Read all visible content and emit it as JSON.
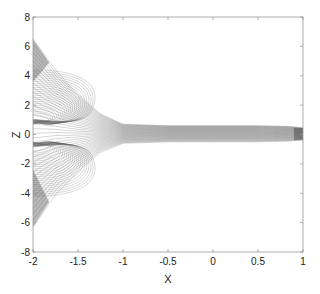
{
  "chart_data": {
    "type": "contour",
    "title": "",
    "xlabel": "X",
    "ylabel": "Z",
    "xlim": [
      -2,
      1
    ],
    "ylim": [
      -8,
      8
    ],
    "xticks": [
      -2,
      -1.5,
      -1,
      -0.5,
      0,
      0.5,
      1
    ],
    "xtick_labels": [
      "-2",
      "-1.5",
      "-1",
      "-0.5",
      "0",
      "0.5",
      "1"
    ],
    "yticks": [
      -8,
      -6,
      -4,
      -2,
      0,
      2,
      4,
      6,
      8
    ],
    "ytick_labels": [
      "-8",
      "-6",
      "-4",
      "-2",
      "0",
      "2",
      "4",
      "6",
      "8"
    ],
    "grid": false,
    "legend": null,
    "line_color": "#555555",
    "envelope": {
      "upper": [
        [
          -2,
          6.5
        ],
        [
          -1.75,
          4.4
        ],
        [
          -1.5,
          2.7
        ],
        [
          -1.25,
          1.4
        ],
        [
          -1.0,
          0.7
        ],
        [
          -0.5,
          0.6
        ],
        [
          0.0,
          0.6
        ],
        [
          0.5,
          0.6
        ],
        [
          0.85,
          0.55
        ],
        [
          1.0,
          0.45
        ]
      ],
      "lower": [
        [
          -2,
          -6.3
        ],
        [
          -1.75,
          -4.1
        ],
        [
          -1.5,
          -2.5
        ],
        [
          -1.25,
          -1.2
        ],
        [
          -1.0,
          -0.6
        ],
        [
          -0.5,
          -0.5
        ],
        [
          0.0,
          -0.5
        ],
        [
          0.5,
          -0.5
        ],
        [
          0.85,
          -0.45
        ],
        [
          1.0,
          -0.35
        ]
      ]
    },
    "contour_count_approx": 40
  }
}
